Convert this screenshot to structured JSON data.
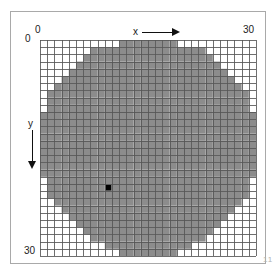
{
  "header": {
    "cut_text": "",
    "page_number": "11"
  },
  "axes": {
    "x_label": "x",
    "y_label": "y",
    "x_origin_label": "0",
    "x_max_label": "30",
    "y_origin_label": "0",
    "y_max_label": "30",
    "x_arrow_icon": "arrow-right-icon",
    "y_arrow_icon": "arrow-down-icon"
  },
  "colors": {
    "fill": "#8c8c8c",
    "marker": "#000000",
    "grid_line": "#555555",
    "background": "#ffffff",
    "frame": "#a9a9a9"
  },
  "chart_data": {
    "type": "heatmap",
    "title": "",
    "subtitle": "",
    "xlabel": "x",
    "ylabel": "y",
    "xlim": [
      0,
      30
    ],
    "ylim": [
      0,
      30
    ],
    "grid": true,
    "legend": "none",
    "cols": 30,
    "rows": 30,
    "cell_size_px": 7.2,
    "circle": {
      "center_x": 15,
      "center_y": 15,
      "radius": 15
    },
    "marker_cell": {
      "x": 9,
      "y": 20,
      "color": "#000000"
    },
    "cell_values_note": "1 = filled gray (inside circle), 0 = empty white",
    "values": [
      [
        0,
        0,
        0,
        0,
        0,
        0,
        0,
        0,
        0,
        0,
        0,
        1,
        1,
        1,
        1,
        1,
        1,
        1,
        1,
        0,
        0,
        0,
        0,
        0,
        0,
        0,
        0,
        0,
        0,
        0
      ],
      [
        0,
        0,
        0,
        0,
        0,
        0,
        0,
        1,
        1,
        1,
        1,
        1,
        1,
        1,
        1,
        1,
        1,
        1,
        1,
        1,
        1,
        1,
        1,
        0,
        0,
        0,
        0,
        0,
        0,
        0
      ],
      [
        0,
        0,
        0,
        0,
        0,
        0,
        1,
        1,
        1,
        1,
        1,
        1,
        1,
        1,
        1,
        1,
        1,
        1,
        1,
        1,
        1,
        1,
        1,
        1,
        0,
        0,
        0,
        0,
        0,
        0
      ],
      [
        0,
        0,
        0,
        0,
        0,
        1,
        1,
        1,
        1,
        1,
        1,
        1,
        1,
        1,
        1,
        1,
        1,
        1,
        1,
        1,
        1,
        1,
        1,
        1,
        1,
        0,
        0,
        0,
        0,
        0
      ],
      [
        0,
        0,
        0,
        0,
        1,
        1,
        1,
        1,
        1,
        1,
        1,
        1,
        1,
        1,
        1,
        1,
        1,
        1,
        1,
        1,
        1,
        1,
        1,
        1,
        1,
        1,
        0,
        0,
        0,
        0
      ],
      [
        0,
        0,
        0,
        1,
        1,
        1,
        1,
        1,
        1,
        1,
        1,
        1,
        1,
        1,
        1,
        1,
        1,
        1,
        1,
        1,
        1,
        1,
        1,
        1,
        1,
        1,
        1,
        0,
        0,
        0
      ],
      [
        0,
        0,
        1,
        1,
        1,
        1,
        1,
        1,
        1,
        1,
        1,
        1,
        1,
        1,
        1,
        1,
        1,
        1,
        1,
        1,
        1,
        1,
        1,
        1,
        1,
        1,
        1,
        1,
        0,
        0
      ],
      [
        0,
        1,
        1,
        1,
        1,
        1,
        1,
        1,
        1,
        1,
        1,
        1,
        1,
        1,
        1,
        1,
        1,
        1,
        1,
        1,
        1,
        1,
        1,
        1,
        1,
        1,
        1,
        1,
        1,
        0
      ],
      [
        0,
        1,
        1,
        1,
        1,
        1,
        1,
        1,
        1,
        1,
        1,
        1,
        1,
        1,
        1,
        1,
        1,
        1,
        1,
        1,
        1,
        1,
        1,
        1,
        1,
        1,
        1,
        1,
        1,
        0
      ],
      [
        0,
        1,
        1,
        1,
        1,
        1,
        1,
        1,
        1,
        1,
        1,
        1,
        1,
        1,
        1,
        1,
        1,
        1,
        1,
        1,
        1,
        1,
        1,
        1,
        1,
        1,
        1,
        1,
        1,
        0
      ],
      [
        1,
        1,
        1,
        1,
        1,
        1,
        1,
        1,
        1,
        1,
        1,
        1,
        1,
        1,
        1,
        1,
        1,
        1,
        1,
        1,
        1,
        1,
        1,
        1,
        1,
        1,
        1,
        1,
        1,
        1
      ],
      [
        1,
        1,
        1,
        1,
        1,
        1,
        1,
        1,
        1,
        1,
        1,
        1,
        1,
        1,
        1,
        1,
        1,
        1,
        1,
        1,
        1,
        1,
        1,
        1,
        1,
        1,
        1,
        1,
        1,
        1
      ],
      [
        1,
        1,
        1,
        1,
        1,
        1,
        1,
        1,
        1,
        1,
        1,
        1,
        1,
        1,
        1,
        1,
        1,
        1,
        1,
        1,
        1,
        1,
        1,
        1,
        1,
        1,
        1,
        1,
        1,
        1
      ],
      [
        1,
        1,
        1,
        1,
        1,
        1,
        1,
        1,
        1,
        1,
        1,
        1,
        1,
        1,
        1,
        1,
        1,
        1,
        1,
        1,
        1,
        1,
        1,
        1,
        1,
        1,
        1,
        1,
        1,
        1
      ],
      [
        1,
        1,
        1,
        1,
        1,
        1,
        1,
        1,
        1,
        1,
        1,
        1,
        1,
        1,
        1,
        1,
        1,
        1,
        1,
        1,
        1,
        1,
        1,
        1,
        1,
        1,
        1,
        1,
        1,
        1
      ],
      [
        1,
        1,
        1,
        1,
        1,
        1,
        1,
        1,
        1,
        1,
        1,
        1,
        1,
        1,
        1,
        1,
        1,
        1,
        1,
        1,
        1,
        1,
        1,
        1,
        1,
        1,
        1,
        1,
        1,
        1
      ],
      [
        1,
        1,
        1,
        1,
        1,
        1,
        1,
        1,
        1,
        1,
        1,
        1,
        1,
        1,
        1,
        1,
        1,
        1,
        1,
        1,
        1,
        1,
        1,
        1,
        1,
        1,
        1,
        1,
        1,
        1
      ],
      [
        1,
        1,
        1,
        1,
        1,
        1,
        1,
        1,
        1,
        1,
        1,
        1,
        1,
        1,
        1,
        1,
        1,
        1,
        1,
        1,
        1,
        1,
        1,
        1,
        1,
        1,
        1,
        1,
        1,
        1
      ],
      [
        1,
        1,
        1,
        1,
        1,
        1,
        1,
        1,
        1,
        1,
        1,
        1,
        1,
        1,
        1,
        1,
        1,
        1,
        1,
        1,
        1,
        1,
        1,
        1,
        1,
        1,
        1,
        1,
        1,
        1
      ],
      [
        0,
        1,
        1,
        1,
        1,
        1,
        1,
        1,
        1,
        1,
        1,
        1,
        1,
        1,
        1,
        1,
        1,
        1,
        1,
        1,
        1,
        1,
        1,
        1,
        1,
        1,
        1,
        1,
        1,
        0
      ],
      [
        0,
        1,
        1,
        1,
        1,
        1,
        1,
        1,
        1,
        1,
        1,
        1,
        1,
        1,
        1,
        1,
        1,
        1,
        1,
        1,
        1,
        1,
        1,
        1,
        1,
        1,
        1,
        1,
        1,
        0
      ],
      [
        0,
        1,
        1,
        1,
        1,
        1,
        1,
        1,
        1,
        1,
        1,
        1,
        1,
        1,
        1,
        1,
        1,
        1,
        1,
        1,
        1,
        1,
        1,
        1,
        1,
        1,
        1,
        1,
        1,
        0
      ],
      [
        0,
        0,
        1,
        1,
        1,
        1,
        1,
        1,
        1,
        1,
        1,
        1,
        1,
        1,
        1,
        1,
        1,
        1,
        1,
        1,
        1,
        1,
        1,
        1,
        1,
        1,
        1,
        1,
        0,
        0
      ],
      [
        0,
        0,
        0,
        1,
        1,
        1,
        1,
        1,
        1,
        1,
        1,
        1,
        1,
        1,
        1,
        1,
        1,
        1,
        1,
        1,
        1,
        1,
        1,
        1,
        1,
        1,
        1,
        0,
        0,
        0
      ],
      [
        0,
        0,
        0,
        0,
        1,
        1,
        1,
        1,
        1,
        1,
        1,
        1,
        1,
        1,
        1,
        1,
        1,
        1,
        1,
        1,
        1,
        1,
        1,
        1,
        1,
        1,
        0,
        0,
        0,
        0
      ],
      [
        0,
        0,
        0,
        0,
        0,
        1,
        1,
        1,
        1,
        1,
        1,
        1,
        1,
        1,
        1,
        1,
        1,
        1,
        1,
        1,
        1,
        1,
        1,
        1,
        1,
        0,
        0,
        0,
        0,
        0
      ],
      [
        0,
        0,
        0,
        0,
        0,
        0,
        1,
        1,
        1,
        1,
        1,
        1,
        1,
        1,
        1,
        1,
        1,
        1,
        1,
        1,
        1,
        1,
        1,
        1,
        0,
        0,
        0,
        0,
        0,
        0
      ],
      [
        0,
        0,
        0,
        0,
        0,
        0,
        0,
        1,
        1,
        1,
        1,
        1,
        1,
        1,
        1,
        1,
        1,
        1,
        1,
        1,
        1,
        1,
        1,
        0,
        0,
        0,
        0,
        0,
        0,
        0
      ],
      [
        0,
        0,
        0,
        0,
        0,
        0,
        0,
        0,
        0,
        1,
        1,
        1,
        1,
        1,
        1,
        1,
        1,
        1,
        1,
        1,
        1,
        0,
        0,
        0,
        0,
        0,
        0,
        0,
        0,
        0
      ],
      [
        0,
        0,
        0,
        0,
        0,
        0,
        0,
        0,
        0,
        0,
        0,
        1,
        1,
        1,
        1,
        1,
        1,
        1,
        1,
        0,
        0,
        0,
        0,
        0,
        0,
        0,
        0,
        0,
        0,
        0
      ]
    ]
  }
}
